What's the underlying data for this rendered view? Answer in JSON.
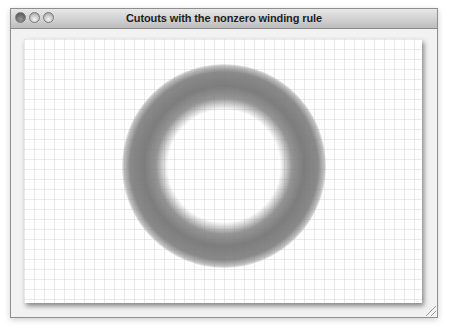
{
  "window": {
    "title": "Cutouts with the nonzero winding rule",
    "state": "inactive",
    "controls": [
      "close",
      "minimize",
      "zoom"
    ]
  },
  "canvas": {
    "background": "#ffffff",
    "grid": {
      "spacing_px": 10,
      "color": "#d8d8d8"
    },
    "shape": {
      "type": "ring",
      "fill_rule": "nonzero",
      "outer_radius_px": 102,
      "inner_radius_px": 60,
      "color": "#777777",
      "shadow": "blurred"
    }
  }
}
